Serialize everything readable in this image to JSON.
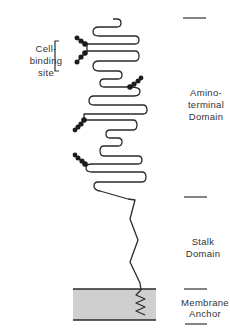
{
  "labels": {
    "cell_binding_site": [
      "Cell-",
      "binding",
      "site"
    ],
    "amino_terminal_domain": [
      "Amino-",
      "terminal",
      "Domain"
    ],
    "stalk_domain": [
      "Stalk",
      "Domain"
    ],
    "membrane_anchor": [
      "Membrane",
      "Anchor"
    ]
  },
  "colors": {
    "line": "#2a2a2a",
    "membrane_fill": "#cfcfcf",
    "glycan_dot": "#1a1a1a"
  },
  "domain_boundaries_y": [
    18,
    198,
    290,
    320
  ]
}
